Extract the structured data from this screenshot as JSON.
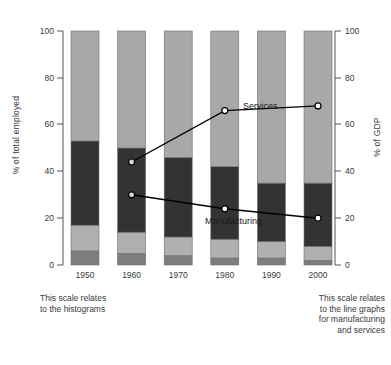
{
  "axes": {
    "left": {
      "title": "% of total employed",
      "ticks": [
        0,
        20,
        40,
        60,
        80,
        100
      ],
      "min": 0,
      "max": 100
    },
    "right": {
      "title": "% of GDP",
      "ticks": [
        0,
        20,
        40,
        60,
        80,
        100
      ],
      "min": 0,
      "max": 100
    }
  },
  "notes": {
    "left": "This scale relates\nto the histograms",
    "right": "This scale relates\nto the line graphs\nfor manufacturing\nand services"
  },
  "series_labels": {
    "services": "Services",
    "manufacturing": "Manufacturing"
  },
  "colors": {
    "segment_agriculture": "#7d7d7d",
    "segment_lower_mid": "#b0b0b0",
    "segment_manufacturing": "#333333",
    "segment_services": "#a8a8a8",
    "line": "#000000",
    "marker_fill_light": "#d8d8d8",
    "marker_fill_white": "#ffffff",
    "axis": "#555555",
    "text": "#3a3a3a"
  },
  "chart_data": {
    "type": "bar",
    "title": "",
    "subtitle": "",
    "xlabel": "",
    "ylabel": "% of total employed",
    "y2label": "% of GDP",
    "ylim": [
      0,
      100
    ],
    "y2lim": [
      0,
      100
    ],
    "grid": false,
    "legend_position": "inline-annotation",
    "stacked": true,
    "categories": [
      "1950",
      "1960",
      "1970",
      "1980",
      "1990",
      "2000"
    ],
    "series": [
      {
        "name": "Agriculture",
        "axis": "left",
        "color": "#7d7d7d",
        "values": [
          6,
          5,
          4,
          3,
          3,
          2
        ]
      },
      {
        "name": "Other lower sector",
        "axis": "left",
        "color": "#b0b0b0",
        "values": [
          11,
          9,
          8,
          8,
          7,
          6
        ]
      },
      {
        "name": "Manufacturing share",
        "axis": "left",
        "color": "#333333",
        "values": [
          36,
          36,
          34,
          31,
          25,
          27
        ]
      },
      {
        "name": "Services share",
        "axis": "left",
        "color": "#a8a8a8",
        "values": [
          47,
          50,
          54,
          58,
          65,
          65
        ]
      }
    ],
    "line_series": [
      {
        "name": "Services",
        "axis": "right",
        "color": "#000000",
        "marker_years": [
          "1960",
          "1980",
          "2000"
        ],
        "x": [
          "1960",
          "1980",
          "2000"
        ],
        "values": [
          44,
          66,
          68
        ]
      },
      {
        "name": "Manufacturing",
        "axis": "right",
        "color": "#000000",
        "marker_years": [
          "1960",
          "1980",
          "2000"
        ],
        "x": [
          "1960",
          "1980",
          "2000"
        ],
        "values": [
          30,
          24,
          20
        ]
      }
    ],
    "annotations": [
      "This scale relates to the histograms",
      "This scale relates to the line graphs for manufacturing and services"
    ]
  }
}
